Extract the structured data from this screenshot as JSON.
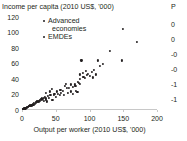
{
  "chart_data": {
    "type": "scatter",
    "title": "Income per capita (2010 US$, '000)",
    "xlabel": "Output per worker (2010 US$, '000)",
    "ylabel": "",
    "xlim": [
      0,
      200
    ],
    "ylim": [
      0,
      120
    ],
    "xticks": [
      "0",
      "50",
      "100",
      "150",
      "200"
    ],
    "xtick_values": [
      0,
      50,
      100,
      150,
      200
    ],
    "yticks": [
      "0",
      "20",
      "40",
      "60",
      "80",
      "100",
      "120"
    ],
    "ytick_values": [
      0,
      20,
      40,
      60,
      80,
      100,
      120
    ],
    "grid": false,
    "legend_position": "top-left-inside",
    "series": [
      {
        "name": "Advanced economies",
        "color": "#231f20",
        "points": [
          [
            36,
            22
          ],
          [
            41,
            24
          ],
          [
            44,
            27
          ],
          [
            48,
            21
          ],
          [
            52,
            24
          ],
          [
            57,
            26
          ],
          [
            60,
            25
          ],
          [
            63,
            31
          ],
          [
            67,
            29
          ],
          [
            70,
            28
          ],
          [
            73,
            33
          ],
          [
            76,
            30
          ],
          [
            79,
            31
          ],
          [
            83,
            36
          ],
          [
            86,
            40
          ],
          [
            86,
            46
          ],
          [
            88,
            64
          ],
          [
            90,
            48
          ],
          [
            91,
            43
          ],
          [
            93,
            41
          ],
          [
            95,
            50
          ],
          [
            96,
            45
          ],
          [
            98,
            47
          ],
          [
            100,
            44
          ],
          [
            103,
            49
          ],
          [
            105,
            42
          ],
          [
            107,
            52
          ],
          [
            110,
            46
          ],
          [
            112,
            64
          ],
          [
            116,
            57
          ],
          [
            120,
            59
          ],
          [
            130,
            76
          ],
          [
            148,
            64
          ],
          [
            150,
            105
          ],
          [
            170,
            88
          ]
        ]
      },
      {
        "name": "EMDEs",
        "color": "#231f20",
        "points": [
          [
            1,
            1
          ],
          [
            2,
            1
          ],
          [
            3,
            2
          ],
          [
            4,
            2
          ],
          [
            5,
            2
          ],
          [
            6,
            3
          ],
          [
            7,
            3
          ],
          [
            8,
            4
          ],
          [
            9,
            4
          ],
          [
            10,
            5
          ],
          [
            11,
            5
          ],
          [
            12,
            6
          ],
          [
            13,
            5
          ],
          [
            14,
            7
          ],
          [
            15,
            6
          ],
          [
            16,
            8
          ],
          [
            17,
            7
          ],
          [
            18,
            9
          ],
          [
            19,
            8
          ],
          [
            20,
            10
          ],
          [
            21,
            9
          ],
          [
            22,
            11
          ],
          [
            23,
            10
          ],
          [
            24,
            12
          ],
          [
            25,
            11
          ],
          [
            26,
            13
          ],
          [
            27,
            12
          ],
          [
            28,
            14
          ],
          [
            29,
            13
          ],
          [
            30,
            15
          ],
          [
            31,
            14
          ],
          [
            32,
            16
          ],
          [
            33,
            12
          ],
          [
            34,
            17
          ],
          [
            35,
            13
          ],
          [
            36,
            15
          ],
          [
            37,
            11
          ],
          [
            38,
            18
          ],
          [
            40,
            16
          ],
          [
            42,
            19
          ],
          [
            45,
            13
          ],
          [
            47,
            20
          ],
          [
            50,
            17
          ],
          [
            53,
            21
          ],
          [
            56,
            20
          ],
          [
            58,
            22
          ],
          [
            62,
            19
          ],
          [
            65,
            34
          ],
          [
            68,
            22
          ],
          [
            72,
            24
          ],
          [
            75,
            21
          ],
          [
            78,
            33
          ],
          [
            80,
            25
          ],
          [
            82,
            23
          ],
          [
            84,
            35
          ],
          [
            86,
            34
          ]
        ]
      }
    ]
  },
  "legend": {
    "items": [
      {
        "label_line1": "Advanced",
        "label_line2": "economies"
      },
      {
        "label_line1": "EMDEs",
        "label_line2": ""
      }
    ]
  },
  "right_panel": {
    "title_fragment": "P",
    "tick_fragments": [
      "0",
      "0",
      "-0",
      "-0",
      "-1",
      "-1"
    ]
  },
  "colors": {
    "marker": "#231f20",
    "axis": "#c8c8c8",
    "text": "#231f20",
    "background": "#ffffff"
  }
}
